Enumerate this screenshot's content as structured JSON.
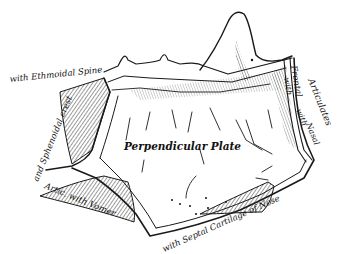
{
  "figure": {
    "ink_color": "#1a1a1a",
    "paper_color": "#ffffff"
  },
  "labels": {
    "center": "Perpendicular Plate",
    "ethmoidal_spine": "with Ethmoidal Spine",
    "sphenoidal_crest": "and Sphenoidal crest",
    "vomer": "Artic. with Vomer",
    "septal_cartilage": "with Septal Cartilage of Nose",
    "articulates": "Articulates",
    "with_nasal_1": "with",
    "nasal": "Nasal",
    "with_frontal": "with",
    "frontal": "Frontal"
  }
}
